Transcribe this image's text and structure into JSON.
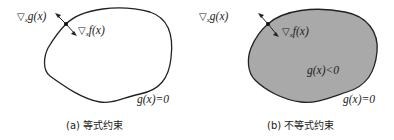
{
  "panels": [
    {
      "id": "a",
      "caption": "(a) 等式约束",
      "constraint_type": "equality",
      "region_filled": false,
      "labels": {
        "grad_g": "g(x)",
        "grad_f": "f(x)",
        "grad_sub": "x",
        "boundary": "g(x)=0"
      }
    },
    {
      "id": "b",
      "caption": "(b) 不等式约束",
      "constraint_type": "inequality",
      "region_filled": true,
      "labels": {
        "grad_g": "g(x)",
        "grad_f": "f(x)",
        "grad_sub": "x",
        "boundary": "g(x)=0",
        "interior": "g(x)<0"
      }
    }
  ],
  "symbols": {
    "nabla": "▽"
  },
  "colors": {
    "outline": "#222222",
    "fill": "#a9a9a9",
    "background": "#ffffff"
  }
}
